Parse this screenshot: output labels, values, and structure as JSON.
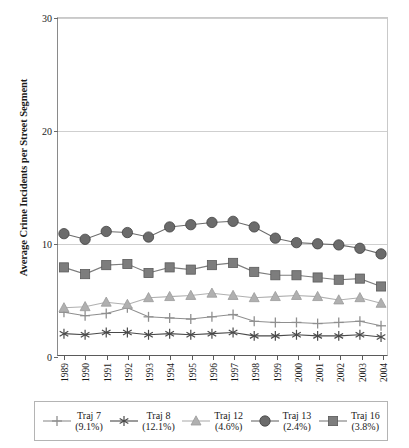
{
  "chart_data": {
    "type": "line",
    "title": "",
    "xlabel": "",
    "ylabel": "Average Crime Incidents per Street Segment",
    "ylim": [
      0,
      30
    ],
    "yticks": [
      0,
      10,
      20,
      30
    ],
    "grid": true,
    "legend_position": "bottom",
    "categories": [
      "1989",
      "1990",
      "1991",
      "1992",
      "1993",
      "1994",
      "1995",
      "1996",
      "1997",
      "1998",
      "1999",
      "2000",
      "2001",
      "2002",
      "2003",
      "2004"
    ],
    "series": [
      {
        "name": "Traj 7",
        "percent": "(9.1%)",
        "marker": "plus",
        "color": "#8f8f8f",
        "values": [
          3.8,
          3.5,
          3.7,
          4.2,
          3.4,
          3.3,
          3.2,
          3.4,
          3.6,
          3.0,
          2.9,
          2.9,
          2.8,
          2.9,
          3.0,
          2.6
        ]
      },
      {
        "name": "Traj 8",
        "percent": "(12.1%)",
        "marker": "asterisk",
        "color": "#4a4a4a",
        "values": [
          1.9,
          1.8,
          2.0,
          2.0,
          1.8,
          1.9,
          1.8,
          1.9,
          2.0,
          1.7,
          1.7,
          1.8,
          1.7,
          1.7,
          1.8,
          1.6
        ]
      },
      {
        "name": "Traj 12",
        "percent": "(4.6%)",
        "marker": "triangle",
        "color": "#b0b0b0",
        "values": [
          4.2,
          4.3,
          4.7,
          4.5,
          5.1,
          5.2,
          5.3,
          5.5,
          5.3,
          5.1,
          5.2,
          5.3,
          5.2,
          4.9,
          5.1,
          4.6
        ]
      },
      {
        "name": "Traj 13",
        "percent": "(2.4%)",
        "marker": "circle",
        "color": "#6b6b6b",
        "values": [
          10.8,
          10.3,
          11.0,
          10.9,
          10.5,
          11.4,
          11.6,
          11.8,
          11.9,
          11.4,
          10.4,
          10.0,
          9.9,
          9.8,
          9.5,
          9.0
        ]
      },
      {
        "name": "Traj 16",
        "percent": "(3.8%)",
        "marker": "square",
        "color": "#7d7d7d",
        "values": [
          7.8,
          7.2,
          8.0,
          8.1,
          7.3,
          7.8,
          7.6,
          8.0,
          8.2,
          7.4,
          7.1,
          7.1,
          6.9,
          6.7,
          6.8,
          6.1
        ]
      }
    ]
  },
  "legend": {
    "entries": [
      {
        "label": "Traj 7",
        "percent": "(9.1%)"
      },
      {
        "label": "Traj 8",
        "percent": "(12.1%)"
      },
      {
        "label": "Traj 12",
        "percent": "(4.6%)"
      },
      {
        "label": "Traj 13",
        "percent": "(2.4%)"
      },
      {
        "label": "Traj 16",
        "percent": "(3.8%)"
      }
    ]
  }
}
